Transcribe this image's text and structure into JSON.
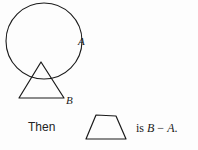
{
  "figure": {
    "kind": "geometry-set-operation-diagram",
    "background_color": "#fdfdfd",
    "stroke_color": "#1a1a1a",
    "shapes": {
      "circle": {
        "name": "circle-A",
        "label": "A",
        "center_x": 44,
        "center_y": 41,
        "radius": 38
      },
      "triangle": {
        "name": "triangle-B",
        "label": "B",
        "apex_x": 41,
        "apex_y": 62,
        "base_left_x": 19,
        "base_right_x": 64,
        "base_y": 98
      },
      "trapezoid": {
        "name": "trapezoid-result",
        "top_left_x": 96,
        "top_right_x": 116,
        "top_y": 115,
        "bottom_left_x": 86,
        "bottom_right_x": 126,
        "bottom_y": 139
      }
    },
    "labels": {
      "circle_label": "A",
      "triangle_label": "B",
      "then_word": "Then",
      "result_prefix": "is",
      "result_minuend": "B",
      "result_operator": "−",
      "result_subtrahend": "A",
      "result_period": ".",
      "result_full": "is B − A."
    }
  }
}
